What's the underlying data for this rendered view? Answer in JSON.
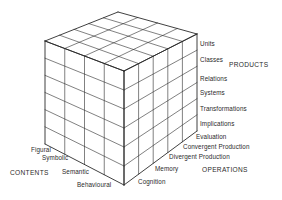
{
  "colors": {
    "line": "#2b2b2b",
    "text": "#2a2a2a",
    "background": "#ffffff"
  },
  "axes": {
    "products": {
      "title": "PRODUCTS",
      "items": [
        "Units",
        "Classes",
        "Relations",
        "Systems",
        "Transformations",
        "Implications"
      ]
    },
    "operations": {
      "title": "OPERATIONS",
      "items": [
        "Evaluation",
        "Convergent Production",
        "Divergent Production",
        "Memory",
        "Cognition"
      ]
    },
    "contents": {
      "title": "CONTENTS",
      "items": [
        "Figural",
        "Symbolic",
        "Semantic",
        "Behavioural"
      ]
    }
  },
  "geometry": {
    "back_top": [
      118,
      12
    ],
    "left_top": [
      45,
      41
    ],
    "right_top": [
      197,
      34
    ],
    "front_top": [
      124,
      71
    ],
    "left_bottom": [
      45,
      144
    ],
    "front_bottom": [
      124,
      185
    ],
    "right_bottom": [
      197,
      131
    ],
    "left_columns": 4,
    "right_columns": 5,
    "rows": 6
  }
}
